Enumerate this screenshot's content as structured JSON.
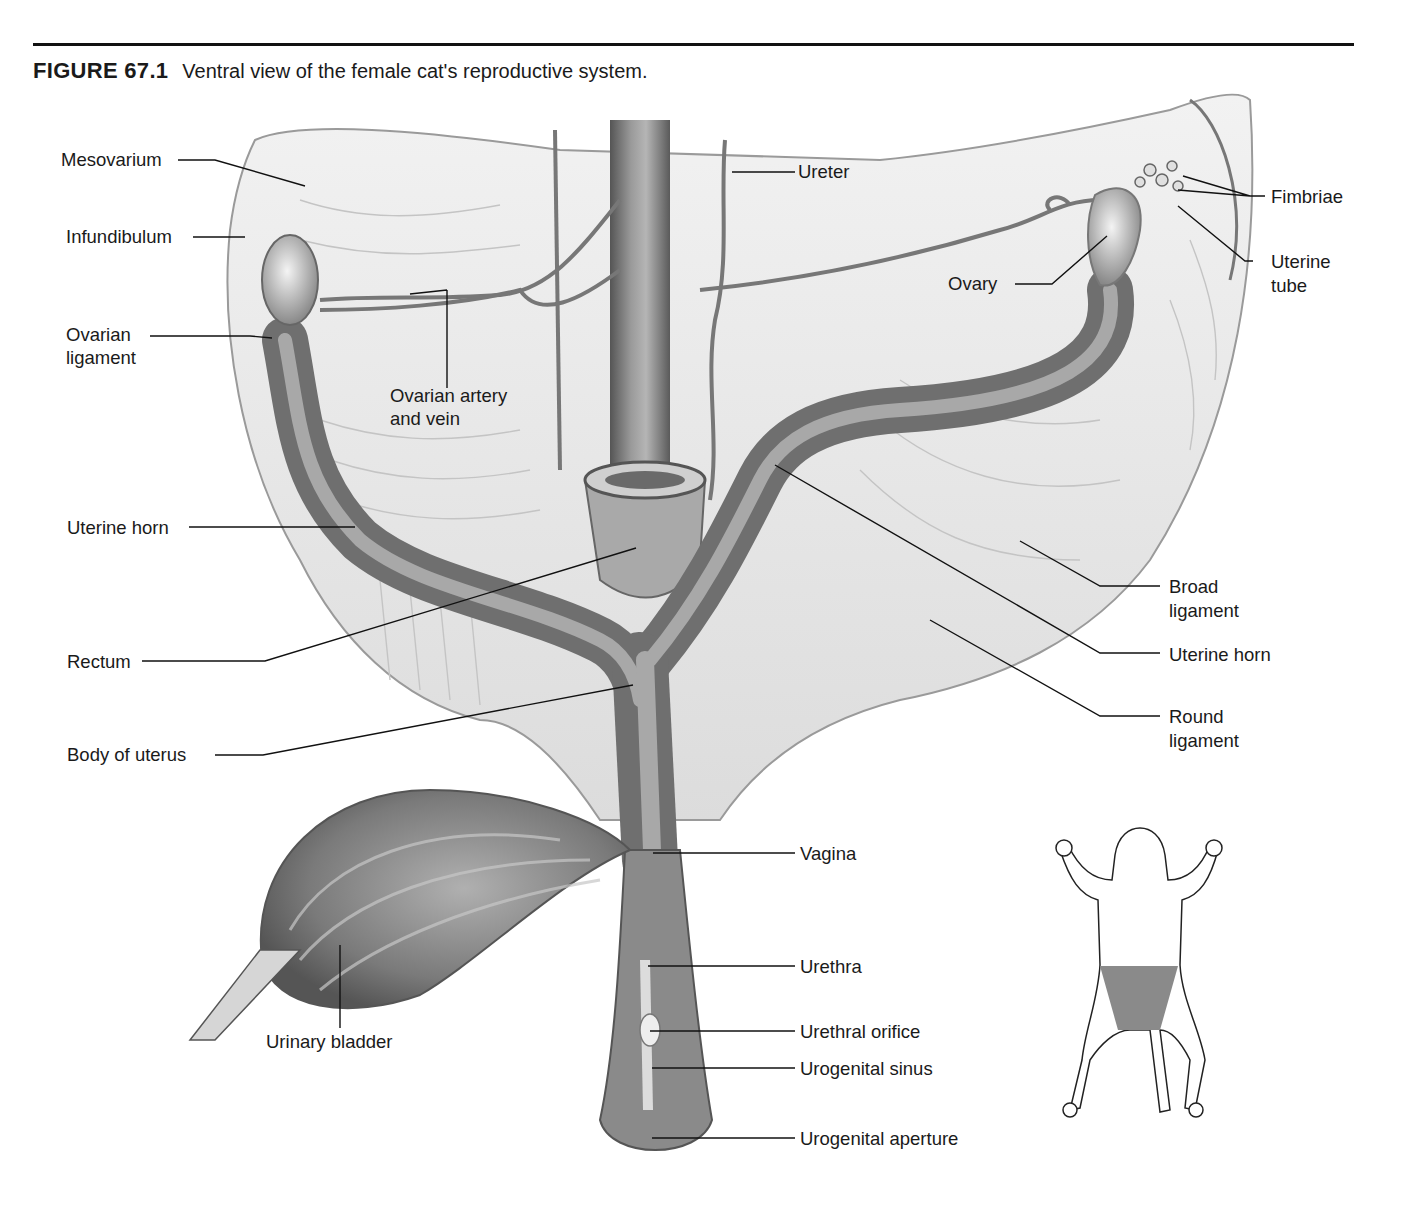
{
  "figure": {
    "number": "FIGURE 67.1",
    "caption": "Ventral view of the female cat's reproductive system."
  },
  "labels": {
    "mesovarium": "Mesovarium",
    "infundibulum": "Infundibulum",
    "ovarian_ligament_1": "Ovarian",
    "ovarian_ligament_2": "ligament",
    "ovarian_artery_1": "Ovarian artery",
    "ovarian_artery_2": "and vein",
    "uterine_horn_left": "Uterine horn",
    "rectum": "Rectum",
    "body_of_uterus": "Body of uterus",
    "urinary_bladder": "Urinary bladder",
    "ureter": "Ureter",
    "fimbriae": "Fimbriae",
    "uterine_tube_1": "Uterine",
    "uterine_tube_2": "tube",
    "ovary": "Ovary",
    "broad_ligament_1": "Broad",
    "broad_ligament_2": "ligament",
    "uterine_horn_right": "Uterine horn",
    "round_ligament_1": "Round",
    "round_ligament_2": "ligament",
    "vagina": "Vagina",
    "urethra": "Urethra",
    "urethral_orifice": "Urethral orifice",
    "urogenital_sinus": "Urogenital sinus",
    "urogenital_aperture": "Urogenital aperture"
  },
  "inset": {
    "description": "cat-orientation-inset",
    "highlight_color": "#8a8a8a"
  }
}
